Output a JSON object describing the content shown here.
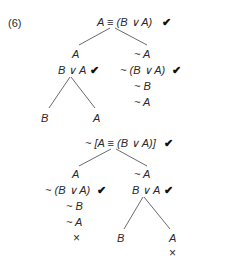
{
  "exercise_label": "(6)",
  "check_mark": "✔",
  "close_mark": "×",
  "tree1": {
    "root": "A ≡ (B ∨ A)",
    "left": {
      "line1": "A",
      "line2": "B ∨ A"
    },
    "right": {
      "line1": "~ A",
      "line2": "~ (B ∨ A)",
      "line3": "~ B",
      "line4": "~ A"
    },
    "left_branches": {
      "left": "B",
      "right": "A"
    }
  },
  "tree2": {
    "root": "~ [A ≡ (B ∨ A)]",
    "left": {
      "line1": "A",
      "line2": "~ (B ∨ A)",
      "line3": "~ B",
      "line4": "~ A"
    },
    "right": {
      "line1": "~ A",
      "line2": "B ∨ A"
    },
    "right_branches": {
      "left": "B",
      "right": "A"
    }
  }
}
